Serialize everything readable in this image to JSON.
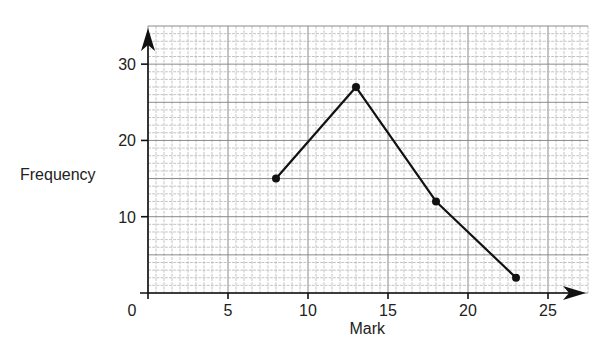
{
  "chart_data": {
    "type": "line",
    "title": "",
    "xlabel": "Mark",
    "ylabel": "Frequency",
    "xlim": [
      0,
      27.5
    ],
    "ylim": [
      0,
      35
    ],
    "x_ticks": [
      0,
      5,
      10,
      15,
      20,
      25
    ],
    "x_tick_labels": [
      "0",
      "5",
      "10",
      "15",
      "20",
      "25"
    ],
    "y_ticks": [
      10,
      20,
      30
    ],
    "y_tick_labels": [
      "10",
      "20",
      "30"
    ],
    "grid": true,
    "grid_minor_x_step": 0.5,
    "grid_minor_y_step": 1,
    "legend": "none",
    "series": [
      {
        "name": "Frequency polygon",
        "color": "#111111",
        "x": [
          8,
          13,
          18,
          23
        ],
        "y": [
          15,
          27,
          12,
          2
        ]
      }
    ]
  }
}
